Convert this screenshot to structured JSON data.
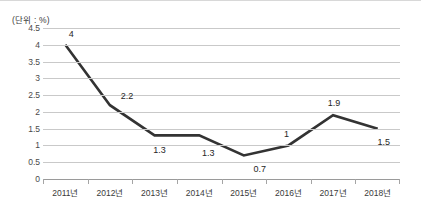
{
  "figure": {
    "unit_label": "(단위 : %)",
    "line_color": "#333333",
    "grid_color": "#c9c9c9",
    "axis_color": "#9a9a9a"
  },
  "chart_data": {
    "type": "line",
    "title": "",
    "subtitle": "",
    "xlabel": "",
    "ylabel": "",
    "unit": "%",
    "unit_note": "(단위 : %)",
    "categories": [
      "2011년",
      "2012년",
      "2013년",
      "2014년",
      "2015년",
      "2016년",
      "2017년",
      "2018년"
    ],
    "values": [
      4,
      2.2,
      1.3,
      1.3,
      0.7,
      1,
      1.9,
      1.5
    ],
    "point_labels": [
      "4",
      "2.2",
      "1.3",
      "1.3",
      "0.7",
      "1",
      "1.9",
      "1.5"
    ],
    "ylim": [
      0,
      4.5
    ],
    "yticks": [
      0,
      0.5,
      1,
      1.5,
      2,
      2.5,
      3,
      3.5,
      4,
      4.5
    ],
    "ytick_labels": [
      "0",
      "0.5",
      "1",
      "1.5",
      "2",
      "2.5",
      "3",
      "3.5",
      "4",
      "4.5"
    ],
    "grid": true,
    "grid_axis": "y",
    "legend": false,
    "legend_position": "none",
    "markers": false,
    "label_offsets": [
      {
        "dx": 6,
        "dy": -11
      },
      {
        "dx": 17,
        "dy": -9
      },
      {
        "dx": 5,
        "dy": 15
      },
      {
        "dx": 9,
        "dy": 18
      },
      {
        "dx": 16,
        "dy": 13
      },
      {
        "dx": -2,
        "dy": -11
      },
      {
        "dx": 1,
        "dy": -12
      },
      {
        "dx": 6,
        "dy": 13
      }
    ]
  }
}
